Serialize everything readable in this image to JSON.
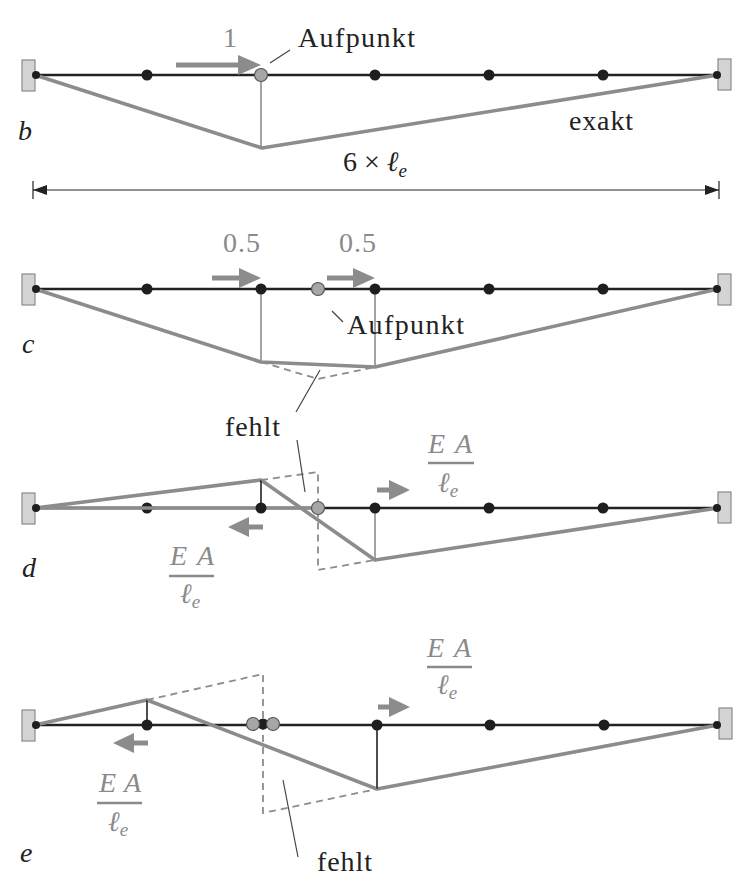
{
  "colors": {
    "beam": "#222222",
    "influence_line": "#8c8c8c",
    "node": "#1e1e1e",
    "aufpunkt_node": "#a6a6a6",
    "support": "#d4d4d4",
    "annotation_grey": "#8a8a8a"
  },
  "mesh": {
    "elements": 6,
    "nodes": 7
  },
  "panels": {
    "b": {
      "label": "b",
      "load": "1",
      "aufpunkt": "Aufpunkt",
      "curve_label": "exakt",
      "dimension": {
        "factor": "6",
        "times": "×",
        "symbol": "ℓ",
        "sub": "e"
      }
    },
    "c": {
      "label": "c",
      "load_left": "0.5",
      "load_right": "0.5",
      "aufpunkt": "Aufpunkt",
      "missing": "fehlt"
    },
    "d": {
      "label": "d",
      "force_right": {
        "num": "EA",
        "den": "ℓ",
        "sub": "e"
      },
      "force_left": {
        "num": "EA",
        "den": "ℓ",
        "sub": "e"
      }
    },
    "e": {
      "label": "e",
      "force_right": {
        "num": "EA",
        "den": "ℓ",
        "sub": "e"
      },
      "force_left": {
        "num": "EA",
        "den": "ℓ",
        "sub": "e"
      },
      "missing": "fehlt"
    }
  }
}
